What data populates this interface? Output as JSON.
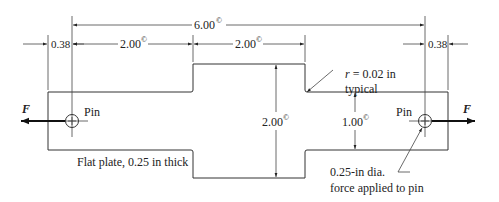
{
  "diagram": {
    "dimensions": {
      "overall_length": {
        "value": "6.00",
        "mark": "©"
      },
      "left_segment": {
        "value": "2.00",
        "mark": "©"
      },
      "middle_segment": {
        "value": "2.00",
        "mark": "©"
      },
      "left_edge_offset": {
        "value": "0.38"
      },
      "right_edge_offset": {
        "value": "0.38"
      },
      "wide_height": {
        "value": "2.00",
        "mark": "©"
      },
      "narrow_height": {
        "value": "1.00",
        "mark": "©"
      }
    },
    "annotations": {
      "fillet_line1": "r = 0.02 in",
      "fillet_r": "r",
      "fillet_rest": " = 0.02 in",
      "fillet_line2": "typical",
      "plate_note": "Flat plate, 0.25 in thick",
      "pin_note_line1": "0.25-in dia.",
      "pin_note_line2": "force applied to pin",
      "pin_left": "Pin",
      "pin_right": "Pin",
      "force_left": "F",
      "force_right": "F"
    }
  }
}
